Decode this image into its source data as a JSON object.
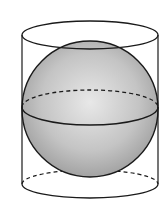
{
  "diagram": {
    "colors": {
      "stroke": "#1a1a1a",
      "sphere_fill_light": "#e6e6e6",
      "sphere_fill_dark": "#9a9a9a",
      "background": "#ffffff"
    },
    "shapes": {
      "cylinder": {
        "left_x": 22,
        "right_x": 158,
        "top_cy": 35,
        "bottom_cy": 184,
        "rx": 68,
        "ry": 14
      },
      "sphere": {
        "cx": 90,
        "cy": 109,
        "r": 68
      },
      "equator": {
        "cy": 108,
        "rx": 68,
        "ry": 18
      }
    }
  }
}
